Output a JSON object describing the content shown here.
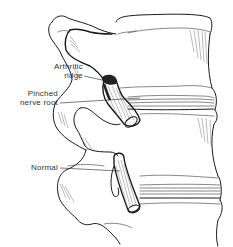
{
  "figure": {
    "labels": {
      "arthritic_ridge_line1": "Arthritic",
      "arthritic_ridge_line2": "ridge",
      "pinched_line1": "Pinched",
      "pinched_line2": "nerve root",
      "normal": "Normal"
    }
  },
  "colors": {
    "background": "#ffffff",
    "ink": "#1a1a1a",
    "label": "#333333"
  }
}
